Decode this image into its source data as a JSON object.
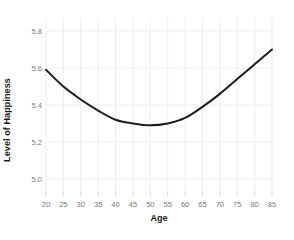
{
  "chart_data": {
    "type": "line",
    "title": "",
    "xlabel": "Age",
    "ylabel": "Level of Happiness",
    "xlim": [
      20,
      85
    ],
    "ylim": [
      4.93,
      5.87
    ],
    "xticks": [
      20,
      25,
      30,
      35,
      40,
      45,
      50,
      55,
      60,
      65,
      70,
      75,
      80,
      85
    ],
    "xticklabels": [
      "20",
      "25",
      "30",
      "35",
      "40",
      "45",
      "50",
      "55",
      "60",
      "65",
      "70",
      "75",
      "80",
      "85"
    ],
    "yticks": [
      5.0,
      5.2,
      5.4,
      5.6,
      5.8
    ],
    "yticklabels": [
      "5.0",
      "5.2",
      "5.4",
      "5.6",
      "5.8"
    ],
    "grid": true,
    "legend": false,
    "series": [
      {
        "name": "Level of Happiness",
        "color": "#1c1c1c",
        "linewidth": 2,
        "x": [
          20,
          25,
          30,
          35,
          40,
          45,
          50,
          55,
          60,
          65,
          70,
          75,
          80,
          85
        ],
        "y": [
          5.59,
          5.5,
          5.43,
          5.37,
          5.32,
          5.3,
          5.29,
          5.3,
          5.33,
          5.39,
          5.46,
          5.54,
          5.62,
          5.7
        ]
      }
    ],
    "annotations": []
  },
  "style": {
    "background": "#ffffff",
    "grid_color": "#e9e9ea",
    "tick_label_color": "#7a7a7a",
    "axis_title_color": "#1a1a1a"
  }
}
